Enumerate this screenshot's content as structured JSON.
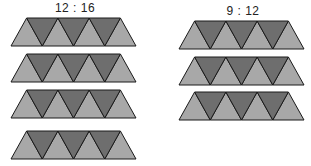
{
  "groups": [
    {
      "ratio_label": "12 : 16",
      "strip_count": 4,
      "triangles_per_strip": {
        "light_up": 4,
        "dark_down": 3
      }
    },
    {
      "ratio_label": "9 : 12",
      "strip_count": 3,
      "triangles_per_strip": {
        "light_up": 4,
        "dark_down": 3
      }
    }
  ],
  "colors": {
    "light_triangle": "#a8a8a8",
    "dark_triangle": "#6e6e6e",
    "outline": "#1a1a1a"
  }
}
